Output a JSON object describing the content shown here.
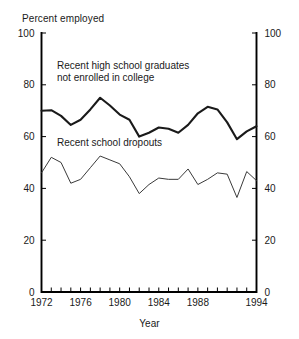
{
  "chart_data": {
    "type": "line",
    "title": "Percent employed",
    "xlabel": "Year",
    "ylabel": "",
    "xlim": [
      1972,
      1994
    ],
    "ylim": [
      0,
      100
    ],
    "grid": false,
    "legend_position": "inline-annotations",
    "y_ticks": [
      0,
      20,
      40,
      60,
      80,
      100
    ],
    "y_ticks_right": [
      0,
      20,
      40,
      60,
      80,
      100
    ],
    "x_tick_labels": [
      "1972",
      "1976",
      "1980",
      "1984",
      "1988",
      "1994"
    ],
    "x_tick_label_years": [
      1972,
      1976,
      1980,
      1984,
      1988,
      1994
    ],
    "x_ticks_minor_every": 1,
    "x": [
      1972,
      1973,
      1974,
      1975,
      1976,
      1977,
      1978,
      1979,
      1980,
      1981,
      1982,
      1983,
      1984,
      1985,
      1986,
      1987,
      1988,
      1989,
      1990,
      1991,
      1992,
      1993,
      1994
    ],
    "series": [
      {
        "name": "Recent high school graduates not enrolled in college",
        "annotation": "Recent high school graduates\nnot enrolled in college",
        "annotation_line1": "Recent high school graduates",
        "annotation_line2": "not enrolled in college",
        "color": "#1a1a1a",
        "line_width": 2.1,
        "values": [
          70.0,
          70.2,
          68.0,
          64.5,
          66.5,
          70.5,
          75.0,
          72.0,
          68.5,
          66.5,
          60.0,
          61.5,
          63.5,
          63.0,
          61.5,
          64.5,
          69.0,
          71.5,
          70.5,
          65.5,
          59.0,
          62.0,
          64.0
        ]
      },
      {
        "name": "Recent school dropouts",
        "annotation": "Recent school dropouts",
        "annotation_line1": "Recent school dropouts",
        "color": "#3a3a3a",
        "line_width": 1.0,
        "values": [
          46.0,
          52.0,
          50.0,
          42.0,
          43.5,
          48.0,
          52.5,
          51.0,
          49.5,
          44.5,
          38.0,
          41.5,
          44.0,
          43.5,
          43.5,
          47.5,
          41.5,
          43.5,
          46.0,
          45.5,
          36.5,
          46.5,
          43.0
        ]
      }
    ]
  }
}
